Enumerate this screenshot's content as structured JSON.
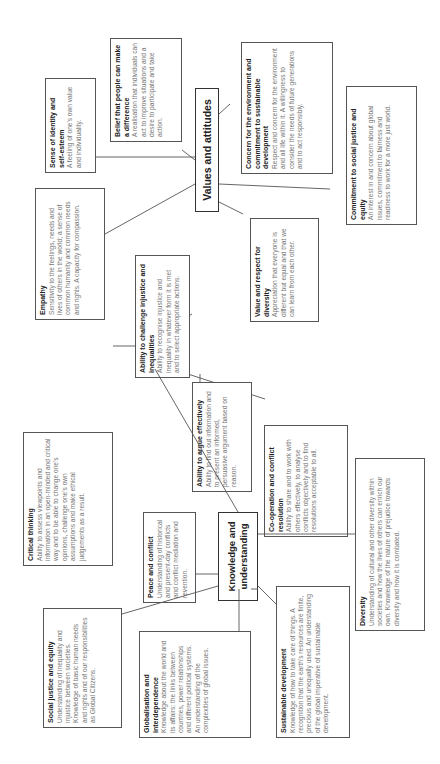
{
  "diagram": {
    "hubs": {
      "values": "Values and attitudes",
      "skills": "Skills",
      "knowledge": "Knowledge and understanding"
    },
    "values_and_attitudes": [
      {
        "title": "Sense of identity and self-esteem",
        "body": "A feeling of one's own value and individuality."
      },
      {
        "title": "Belief that people can make a difference",
        "body": "A realisation that individuals can act to improve situations and a desire to participate and take action."
      },
      {
        "title": "Concern for the environment and commitment to sustainable development",
        "body": "Respect and concern for the environment and all life within it. A willingness to consider the needs of future generations and to act responsibly."
      },
      {
        "title": "Commitment to social justice and equity",
        "body": "An interest in and concern about global issues, commitment to fairness and readiness to work for a more just world."
      },
      {
        "title": "Value and respect for diversity",
        "body": "Appreciation that everyone is different but equal and that we can learn from each other."
      },
      {
        "title": "Empathy",
        "body": "Sensitivity to the feelings, needs and lives of others in the world; a sense of common humanity and common needs and rights. A capacity for compassion."
      }
    ],
    "skills": [
      {
        "title": "Ability to challenge injustice and inequalities",
        "body": "Ability to recognise injustice and inequality in whatever form it is met and to select appropriate actions."
      },
      {
        "title": "Critical thinking",
        "body": "Ability to assess viewpoints and information in an open-minded and critical way and to be able to change one's opinions, challenge one's own assumptions and make ethical judgements as a result."
      },
      {
        "title": "Ability to argue effectively",
        "body": "Ability to find out information and to present an informed, persuasive argument based on reason."
      },
      {
        "title": "Co-operation and conflict resolution",
        "body": "Ability to share and to work with others effectively, to analyse conflicts objectively and to find resolutions acceptable to all."
      }
    ],
    "knowledge_and_understanding": [
      {
        "title": "Peace and conflict",
        "body": "Understanding of historical and present-day conflicts and conflict mediation and revention."
      },
      {
        "title": "Social justice and equity",
        "body": "Understanding of inequality and injustice between societies. Knowledge of basic human needs and rights and of our responsibilities as Global Citizens."
      },
      {
        "title": "Globalisation and interdependence",
        "body": "Knowledge about the world and its affairs: the links between countries, power relationships and different political systems. An understanding of the complexities of global issues."
      },
      {
        "title": "Sustainable development",
        "body": "Knowledge of how to take care of things. A recognition that the earth's resources are finite, precious and unequally used. An understanding of the global imperative of sustainable development."
      },
      {
        "title": "Diversity",
        "body": "Understanding of cultural and other diversity within societies and how the lives of others can enrich our own. Knowledge of the nature of prejudice towards diversity and how it is combated."
      }
    ]
  }
}
